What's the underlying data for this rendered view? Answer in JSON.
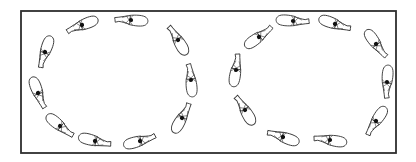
{
  "figure": {
    "colors": {
      "background": "#ffffff",
      "frame": "#2e2e2e",
      "outline": "#3a3a3a",
      "rider": "#111111"
    },
    "arena": {
      "x": 21,
      "y": 11,
      "width": 375,
      "height": 142
    },
    "rings": [
      {
        "name": "left-circle",
        "horses": [
          {
            "x": 82,
            "y": 25,
            "heading": 160
          },
          {
            "x": 131,
            "y": 20,
            "heading": 185
          },
          {
            "x": 178,
            "y": 40,
            "heading": 240
          },
          {
            "x": 191,
            "y": 80,
            "heading": 265
          },
          {
            "x": 182,
            "y": 118,
            "heading": 300
          },
          {
            "x": 140,
            "y": 141,
            "heading": 345
          },
          {
            "x": 95,
            "y": 141,
            "heading": 15
          },
          {
            "x": 60,
            "y": 126,
            "heading": 40
          },
          {
            "x": 38,
            "y": 93,
            "heading": 70
          },
          {
            "x": 45,
            "y": 52,
            "heading": 110
          }
        ]
      },
      {
        "name": "right-circle",
        "horses": [
          {
            "x": 293,
            "y": 21,
            "heading": 5
          },
          {
            "x": 335,
            "y": 24,
            "heading": 20
          },
          {
            "x": 376,
            "y": 44,
            "heading": 55
          },
          {
            "x": 387,
            "y": 82,
            "heading": 95
          },
          {
            "x": 376,
            "y": 121,
            "heading": 125
          },
          {
            "x": 330,
            "y": 140,
            "heading": 190
          },
          {
            "x": 283,
            "y": 137,
            "heading": 200
          },
          {
            "x": 245,
            "y": 110,
            "heading": 240
          },
          {
            "x": 236,
            "y": 70,
            "heading": 280
          },
          {
            "x": 259,
            "y": 37,
            "heading": 325
          }
        ]
      }
    ]
  }
}
